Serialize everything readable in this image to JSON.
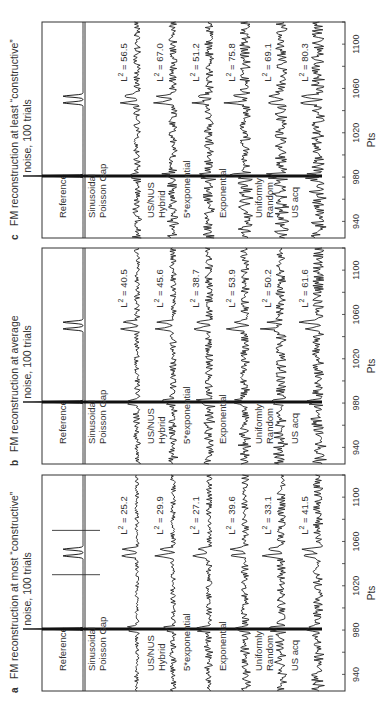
{
  "figure": {
    "axis_label": "Pts",
    "ticks": [
      940,
      980,
      1020,
      1060,
      1100
    ],
    "l2_prefix": "L",
    "l2_sup": "2",
    "l2_eq": " = "
  },
  "chart_data": [
    {
      "type": "line",
      "panel": "a",
      "title_line1": "FM reconstruction at most “constructive”",
      "title_line2": "noise, 100 trials",
      "xlabel": "Pts",
      "xlim": [
        925,
        1120
      ],
      "xticks": [
        940,
        980,
        1020,
        1060,
        1100
      ],
      "reference_label": "Reference",
      "reference_markers": [
        1030,
        1070
      ],
      "series": [
        {
          "name": "Sinusoidal Poisson Gap",
          "label_lines": [
            "Sinusoidal",
            "Poisson Gap"
          ],
          "l2": "25.2"
        },
        {
          "name": "US/NUS Hybrid",
          "label_lines": [
            "US/NUS",
            "Hybrid"
          ],
          "l2": "29.9"
        },
        {
          "name": "5*exponential",
          "label_lines": [
            "5*exponential"
          ],
          "l2": "27.1"
        },
        {
          "name": "Exponential",
          "label_lines": [
            "Exponential"
          ],
          "l2": "39.6"
        },
        {
          "name": "Uniformly Random",
          "label_lines": [
            "Uniformly",
            "Random"
          ],
          "l2": "33.1"
        },
        {
          "name": "US acq",
          "label_lines": [
            "US acq"
          ],
          "l2": "41.5"
        }
      ]
    },
    {
      "type": "line",
      "panel": "b",
      "title_line1": "FM reconstruction at average",
      "title_line2": "noise, 100 trials",
      "xlabel": "Pts",
      "xlim": [
        925,
        1120
      ],
      "xticks": [
        940,
        980,
        1020,
        1060,
        1100
      ],
      "reference_label": "Reference",
      "reference_markers": [],
      "series": [
        {
          "name": "Sinusoidal Poisson Gap",
          "label_lines": [
            "Sinusoidal",
            "Poisson Gap"
          ],
          "l2": "40.5"
        },
        {
          "name": "US/NUS Hybrid",
          "label_lines": [
            "US/NUS",
            "Hybrid"
          ],
          "l2": "45.6"
        },
        {
          "name": "5*exponential",
          "label_lines": [
            "5*exponential"
          ],
          "l2": "38.7"
        },
        {
          "name": "Exponential",
          "label_lines": [
            "Exponential"
          ],
          "l2": "53.9"
        },
        {
          "name": "Uniformly Random",
          "label_lines": [
            "Uniformly",
            "Random"
          ],
          "l2": "50.2"
        },
        {
          "name": "US acq",
          "label_lines": [
            "US acq"
          ],
          "l2": "61.6"
        }
      ]
    },
    {
      "type": "line",
      "panel": "c",
      "title_line1": "FM reconstruction at least “constructive”",
      "title_line2": "noise, 100 trials",
      "xlabel": "Pts",
      "xlim": [
        925,
        1120
      ],
      "xticks": [
        940,
        980,
        1020,
        1060,
        1100
      ],
      "reference_label": "Reference",
      "reference_markers": [],
      "series": [
        {
          "name": "Sinusoidal Poisson Gap",
          "label_lines": [
            "Sinusoidal",
            "Poisson Gap"
          ],
          "l2": "56.5"
        },
        {
          "name": "US/NUS Hybrid",
          "label_lines": [
            "US/NUS",
            "Hybrid"
          ],
          "l2": "67.0"
        },
        {
          "name": "5*exponential",
          "label_lines": [
            "5*exponential"
          ],
          "l2": "51.2"
        },
        {
          "name": "Exponential",
          "label_lines": [
            "Exponential"
          ],
          "l2": "75.8"
        },
        {
          "name": "Uniformly Random",
          "label_lines": [
            "Uniformly",
            "Random"
          ],
          "l2": "69.1"
        },
        {
          "name": "US acq",
          "label_lines": [
            "US acq"
          ],
          "l2": "80.3"
        }
      ]
    }
  ]
}
